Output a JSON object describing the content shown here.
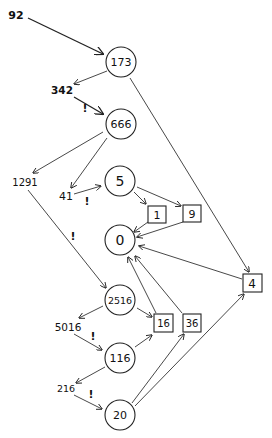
{
  "header": {
    "text": ""
  },
  "colors": {
    "ink": "#222222",
    "background": "#ffffff"
  },
  "nodes": {
    "n173": {
      "label": "173",
      "shape": "circle",
      "x": 121,
      "y": 62,
      "r": 15
    },
    "n666": {
      "label": "666",
      "shape": "circle",
      "x": 121,
      "y": 124,
      "r": 15
    },
    "n5": {
      "label": "5",
      "shape": "circle",
      "x": 120,
      "y": 181,
      "r": 15
    },
    "n0": {
      "label": "0",
      "shape": "circle",
      "x": 120,
      "y": 240,
      "r": 15
    },
    "n2516": {
      "label": "2516",
      "shape": "circle",
      "x": 120,
      "y": 300,
      "r": 15
    },
    "n116": {
      "label": "116",
      "shape": "circle",
      "x": 120,
      "y": 358,
      "r": 15
    },
    "n20": {
      "label": "20",
      "shape": "circle",
      "x": 120,
      "y": 415,
      "r": 15
    },
    "b1": {
      "label": "1",
      "shape": "box",
      "x": 157,
      "y": 214
    },
    "b9": {
      "label": "9",
      "shape": "box",
      "x": 192,
      "y": 213
    },
    "b4": {
      "label": "4",
      "shape": "box",
      "x": 252,
      "y": 283
    },
    "b16": {
      "label": "16",
      "shape": "box",
      "x": 163,
      "y": 323
    },
    "b36": {
      "label": "36",
      "shape": "box",
      "x": 192,
      "y": 323
    }
  },
  "labels": {
    "l92": {
      "text": "92",
      "x": 16,
      "y": 19
    },
    "l342": {
      "text": "342",
      "x": 62,
      "y": 94
    },
    "l1291": {
      "text": "1291",
      "x": 25,
      "y": 186
    },
    "l41": {
      "text": "41",
      "x": 66,
      "y": 200
    },
    "l5016": {
      "text": "5016",
      "x": 68,
      "y": 331
    },
    "l216": {
      "text": "216",
      "x": 66,
      "y": 392
    }
  },
  "marks": {
    "m1": {
      "text": "!",
      "x": 85,
      "y": 112
    },
    "m2": {
      "text": "!",
      "x": 87,
      "y": 205
    },
    "m3": {
      "text": "!",
      "x": 73,
      "y": 240
    },
    "m4": {
      "text": "!",
      "x": 93,
      "y": 340
    },
    "m5": {
      "text": "!",
      "x": 91,
      "y": 398
    }
  },
  "edges": [
    {
      "from": "92",
      "to": "173"
    },
    {
      "from": "173",
      "to": "342"
    },
    {
      "from": "342",
      "to": "666",
      "mark": "!"
    },
    {
      "from": "173",
      "to": "4"
    },
    {
      "from": "666",
      "to": "1291"
    },
    {
      "from": "666",
      "to": "41"
    },
    {
      "from": "41",
      "to": "5",
      "mark": "!"
    },
    {
      "from": "5",
      "to": "1"
    },
    {
      "from": "5",
      "to": "9"
    },
    {
      "from": "1",
      "to": "0"
    },
    {
      "from": "9",
      "to": "0"
    },
    {
      "from": "4",
      "to": "0"
    },
    {
      "from": "1291",
      "to": "2516",
      "mark": "!"
    },
    {
      "from": "2516",
      "to": "5016"
    },
    {
      "from": "2516",
      "to": "16"
    },
    {
      "from": "16",
      "to": "0"
    },
    {
      "from": "36",
      "to": "0"
    },
    {
      "from": "5016",
      "to": "116",
      "mark": "!"
    },
    {
      "from": "116",
      "to": "16"
    },
    {
      "from": "116",
      "to": "216"
    },
    {
      "from": "216",
      "to": "20",
      "mark": "!"
    },
    {
      "from": "20",
      "to": "36"
    },
    {
      "from": "20",
      "to": "4"
    }
  ]
}
